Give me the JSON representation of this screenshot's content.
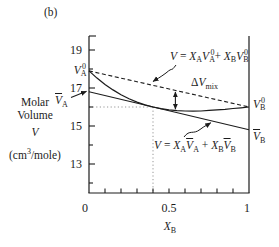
{
  "figure_label": "(b)",
  "colors": {
    "ink": "#1c1c1c",
    "dotted_guide": "#8a8a8a",
    "background": "#ffffff"
  },
  "y_axis": {
    "title_line1": "Molar",
    "title_line2": "Volume",
    "symbol": "V",
    "units_tokens": [
      [
        "(cm",
        ""
      ],
      [
        "3",
        "p"
      ],
      [
        "/mole)",
        ""
      ]
    ],
    "major_tick_labels": [
      "19",
      "17",
      "15",
      "13"
    ],
    "major_tick_values": [
      19,
      17,
      15,
      13
    ],
    "minor_tick_values": [
      18,
      16,
      14,
      12
    ]
  },
  "x_axis": {
    "label_tokens": [
      [
        "X",
        "i"
      ],
      [
        "B",
        "b"
      ]
    ],
    "tick_labels": [
      "0",
      "0.5",
      "1"
    ],
    "tick_values": [
      0,
      0.5,
      1
    ],
    "minor_tick_values": [
      0.1,
      0.2,
      0.3,
      0.4,
      0.5,
      0.6,
      0.7,
      0.8,
      0.9
    ]
  },
  "point_labels": {
    "va0": {
      "tokens": [
        [
          "V",
          "i"
        ],
        [
          "A",
          "b"
        ],
        [
          "0",
          "pt"
        ]
      ]
    },
    "vabar": {
      "tokens": [
        [
          "V",
          "bar"
        ],
        [
          "A",
          "b"
        ]
      ]
    },
    "vb0": {
      "tokens": [
        [
          "V",
          "i"
        ],
        [
          "B",
          "b"
        ],
        [
          "0",
          "pt"
        ]
      ]
    },
    "vbbar": {
      "tokens": [
        [
          "V",
          "bar"
        ],
        [
          "B",
          "b"
        ]
      ]
    }
  },
  "annotations": {
    "formula_ideal": {
      "tokens": [
        [
          "V",
          "i"
        ],
        [
          " = ",
          ""
        ],
        [
          "X",
          "i"
        ],
        [
          "A",
          "b"
        ],
        [
          "V",
          "i"
        ],
        [
          "A",
          "b"
        ],
        [
          "0",
          "pt"
        ],
        [
          "+ ",
          ""
        ],
        [
          "X",
          "i"
        ],
        [
          "B",
          "b"
        ],
        [
          "V",
          "i"
        ],
        [
          "B",
          "b"
        ],
        [
          "0",
          "pt"
        ]
      ]
    },
    "formula_real": {
      "tokens": [
        [
          "V",
          "i"
        ],
        [
          " = ",
          ""
        ],
        [
          "X",
          "i"
        ],
        [
          "A",
          "b"
        ],
        [
          "V",
          "bar"
        ],
        [
          "A",
          "b"
        ],
        [
          " + ",
          ""
        ],
        [
          "X",
          "i"
        ],
        [
          "B",
          "b"
        ],
        [
          "V",
          "bar"
        ],
        [
          "B",
          "b"
        ]
      ]
    },
    "delta_vmix": {
      "tokens": [
        [
          "Δ",
          ""
        ],
        [
          "V",
          "i"
        ],
        [
          "mix",
          "b"
        ]
      ]
    }
  },
  "chart_data": {
    "type": "line",
    "title": "",
    "xlabel": "X_B (mole fraction of B)",
    "ylabel": "Molar Volume V (cm3/mole)",
    "xlim": [
      0,
      1
    ],
    "ylim": [
      11.5,
      19.75
    ],
    "grid": false,
    "legend": "none (annotated with arrows)",
    "x_major_ticks": [
      0,
      0.5,
      1
    ],
    "x_minor_ticks": [
      0.1,
      0.2,
      0.3,
      0.4,
      0.5,
      0.6,
      0.7,
      0.8,
      0.9
    ],
    "y_major_ticks": [
      19,
      17,
      15,
      13
    ],
    "y_minor_ticks": [
      18,
      16,
      14,
      12
    ],
    "series": [
      {
        "name": "ideal-mixing-line",
        "label": "V = XA VA0 + XB VB0",
        "style": "dashed",
        "x": [
          0,
          1
        ],
        "y": [
          17.9,
          16.0
        ]
      },
      {
        "name": "solution-curve",
        "label": "real solution molar volume",
        "style": "solid",
        "x": [
          0,
          0.05,
          0.1,
          0.15,
          0.2,
          0.25,
          0.3,
          0.35,
          0.4,
          0.45,
          0.5,
          0.55,
          0.6,
          0.65,
          0.7,
          0.75,
          0.8,
          0.85,
          0.9,
          0.95,
          1
        ],
        "y": [
          17.9,
          17.52,
          17.19,
          16.9,
          16.65,
          16.43,
          16.26,
          16.11,
          16.0,
          15.91,
          15.85,
          15.81,
          15.79,
          15.78,
          15.79,
          15.82,
          15.85,
          15.88,
          15.92,
          15.96,
          16.0
        ]
      },
      {
        "name": "tangent-line",
        "label": "V = XA VbarA + XB VbarB (tangent at XB = 0.4)",
        "style": "solid",
        "x": [
          0,
          1
        ],
        "y": [
          16.8,
          14.8
        ]
      }
    ],
    "key_values": {
      "V_A_pure": 17.9,
      "V_B_pure": 16.0,
      "V_A_partial": 16.8,
      "V_B_partial": 14.8,
      "tangent_composition_XB": 0.4,
      "tangent_volume": 16.0,
      "dVmix_arrow_XB": 0.54
    }
  }
}
